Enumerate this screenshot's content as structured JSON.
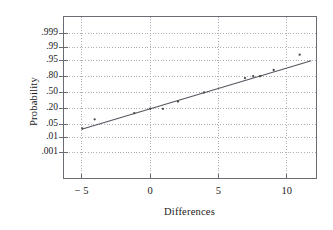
{
  "chart_data": {
    "type": "scatter",
    "title": "",
    "subtitle": "",
    "xlabel": "Differences",
    "ylabel": "Probability",
    "plot_kind": "normal-probability-plot",
    "grid": true,
    "grid_style": "dotted",
    "legend": "none",
    "xlim": [
      -6.3,
      12.1
    ],
    "xticks": [
      -5,
      0,
      5,
      10
    ],
    "xticklabels": [
      "− 5",
      "0",
      "5",
      "10"
    ],
    "yticks": [
      0.001,
      0.01,
      0.05,
      0.2,
      0.5,
      0.8,
      0.95,
      0.99,
      0.999
    ],
    "yticklabels": [
      ".001",
      ".01",
      ".05",
      ".20",
      ".50",
      ".80",
      ".95",
      ".99",
      ".999"
    ],
    "ylim_prob": [
      0.0002,
      0.9996
    ],
    "marker": "dot",
    "marker_color": "#4a4a4a",
    "line_color": "#55555f",
    "axis_color": "#6b6b73",
    "grid_color": "#9a9aa2",
    "points": [
      {
        "x": -4.95,
        "p": 0.031
      },
      {
        "x": -4.05,
        "p": 0.082
      },
      {
        "x": -1.15,
        "p": 0.142
      },
      {
        "x": 0.02,
        "p": 0.2
      },
      {
        "x": 0.95,
        "p": 0.198
      },
      {
        "x": 2.05,
        "p": 0.32
      },
      {
        "x": 3.95,
        "p": 0.5
      },
      {
        "x": 6.95,
        "p": 0.772
      },
      {
        "x": 7.55,
        "p": 0.8
      },
      {
        "x": 8.05,
        "p": 0.8
      },
      {
        "x": 9.05,
        "p": 0.878
      },
      {
        "x": 10.95,
        "p": 0.975
      }
    ],
    "fit_line": {
      "name": "reference line",
      "x_start": -5.0,
      "p_start": 0.028,
      "x_end": 11.8,
      "p_end": 0.95
    }
  },
  "axes": {
    "y_axis_title": "Probability",
    "x_axis_title": "Differences"
  }
}
